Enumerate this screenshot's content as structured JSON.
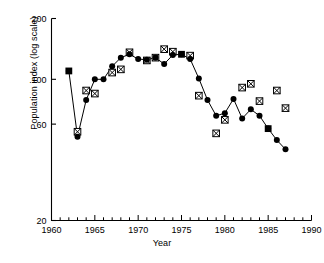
{
  "chart_data": {
    "type": "line",
    "title": "",
    "xlabel": "Year",
    "ylabel": "Population index (log scale)",
    "xlim": [
      1960,
      1990
    ],
    "ylim": [
      20,
      200
    ],
    "yscale": "log",
    "grid": false,
    "legend": "none",
    "x_major_ticks": [
      1960,
      1965,
      1970,
      1975,
      1980,
      1985,
      1990
    ],
    "x_major_tick_labels": [
      "1960",
      "1965",
      "1970",
      "1975",
      "1980",
      "1985",
      "1990"
    ],
    "x_minor_tick_step": 1,
    "y_ticks": [
      20,
      60,
      100,
      200
    ],
    "y_tick_labels": [
      "20",
      "60",
      "100",
      "200"
    ],
    "series": [
      {
        "name": "population-index-line",
        "marker": "filled-circle",
        "connected": true,
        "x": [
          1962,
          1963,
          1964,
          1965,
          1966,
          1967,
          1968,
          1969,
          1970,
          1971,
          1972,
          1973,
          1974,
          1975,
          1976,
          1977,
          1978,
          1979,
          1980,
          1981,
          1982,
          1983,
          1984,
          1985,
          1986,
          1987
        ],
        "values": [
          110,
          52,
          79,
          100,
          100,
          116,
          128,
          133,
          126,
          125,
          128,
          119,
          132,
          133,
          126,
          101,
          79,
          66,
          68,
          80,
          64,
          71,
          66,
          57,
          50,
          45
        ]
      },
      {
        "name": "highlight-years",
        "marker": "filled-square",
        "connected": false,
        "x": [
          1962,
          1975,
          1985
        ],
        "values": [
          110,
          133,
          57
        ]
      },
      {
        "name": "secondary-index",
        "marker": "crossed-square",
        "connected": false,
        "x": [
          1963,
          1964,
          1965,
          1967,
          1968,
          1969,
          1971,
          1972,
          1973,
          1974,
          1976,
          1977,
          1979,
          1980,
          1982,
          1983,
          1984,
          1986,
          1987
        ],
        "values": [
          55,
          88,
          85,
          108,
          112,
          136,
          124,
          128,
          141,
          137,
          131,
          83,
          54,
          63,
          91,
          95,
          78,
          88,
          72
        ]
      }
    ]
  }
}
